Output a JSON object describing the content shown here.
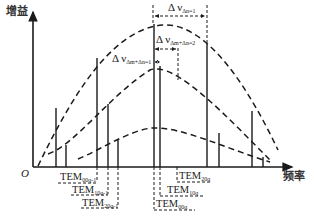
{
  "axes": {
    "y_label": "增益",
    "x_label": "频率",
    "origin_label": "O"
  },
  "annotations": {
    "delta_nu_main": {
      "symbol": "Δ ν",
      "subscript": "Δn=1"
    },
    "delta_nu_two": {
      "symbol": "Δ ν",
      "subscript": "Δm+Δn=2"
    },
    "delta_nu_one": {
      "symbol": "Δ ν",
      "subscript": "Δm+Δn=1"
    }
  },
  "mode_labels": {
    "left": [
      {
        "text": "TEM",
        "subscript": "00q-1"
      },
      {
        "text": "TEM",
        "subscript": "10q-1"
      },
      {
        "text": "TEM",
        "subscript": "20q-1"
      }
    ],
    "right": [
      {
        "text": "TEM",
        "subscript": "20q"
      },
      {
        "text": "TEM",
        "subscript": "10q"
      },
      {
        "text": "TEM",
        "subscript": "00q"
      }
    ]
  },
  "colors": {
    "ink": "#1a1a1a",
    "background": "#ffffff"
  }
}
